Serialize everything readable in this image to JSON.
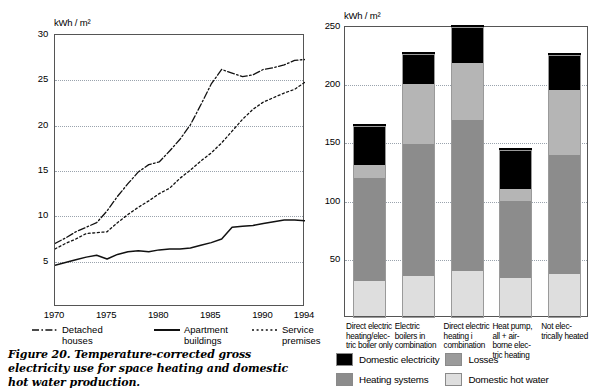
{
  "caption": "Figure 20.  Temperature-corrected gross electricity use for space heating and domestic hot water production.",
  "line_chart": {
    "unit_label": "kWh / m²",
    "y_ticks": [
      "5",
      "10",
      "15",
      "20",
      "25",
      "30"
    ],
    "x_ticks": [
      "1970",
      "1975",
      "1980",
      "1985",
      "1990",
      "1994"
    ],
    "legend": [
      {
        "label_line1": "Detached",
        "label_line2": "houses",
        "style": "dash-dot"
      },
      {
        "label_line1": "Apartment",
        "label_line2": "buildings",
        "style": "solid"
      },
      {
        "label_line1": "Service",
        "label_line2": "premises",
        "style": "dotted"
      }
    ]
  },
  "bar_chart": {
    "unit_label": "kWh / m²",
    "y_ticks": [
      "50",
      "100",
      "150",
      "200",
      "250"
    ],
    "categories": [
      "Direct electric\nheating/elec-\ntric boiler only",
      "Electric\nboilers in\ncombination",
      "Direct electric\nheating i\ncombination",
      "Heat pump,\nall + air-\nborne elec-\ntric heating",
      "Not elec-\ntrically heated"
    ],
    "legend": [
      {
        "label": "Domestic electricity",
        "color": "#000000"
      },
      {
        "label": "Losses",
        "color": "#9b9b9b"
      },
      {
        "label": "Heating systems",
        "color": "#8c8c8c"
      },
      {
        "label": "Domestic hot water",
        "color": "#dedede"
      }
    ]
  },
  "chart_data": [
    {
      "type": "line",
      "title": "Temperature-corrected gross electricity use",
      "xlabel": "",
      "ylabel": "kWh / m²",
      "xlim": [
        1970,
        1994
      ],
      "ylim": [
        0,
        30
      ],
      "grid": true,
      "legend_position": "below",
      "x": [
        1970,
        1971,
        1972,
        1973,
        1974,
        1975,
        1976,
        1977,
        1978,
        1979,
        1980,
        1981,
        1982,
        1983,
        1984,
        1985,
        1986,
        1987,
        1988,
        1989,
        1990,
        1991,
        1992,
        1993,
        1994
      ],
      "series": [
        {
          "name": "Detached houses",
          "style": "dash-dot",
          "values": [
            7.0,
            7.6,
            8.3,
            8.8,
            9.3,
            10.6,
            12.2,
            13.6,
            14.9,
            15.7,
            16.0,
            17.2,
            18.5,
            20.1,
            22.3,
            24.6,
            26.2,
            25.8,
            25.4,
            25.6,
            26.2,
            26.4,
            26.7,
            27.2,
            27.3
          ]
        },
        {
          "name": "Apartment buildings",
          "style": "solid",
          "values": [
            4.6,
            4.9,
            5.2,
            5.5,
            5.7,
            5.3,
            5.8,
            6.1,
            6.2,
            6.1,
            6.3,
            6.4,
            6.4,
            6.5,
            6.8,
            7.1,
            7.5,
            8.8,
            8.9,
            9.0,
            9.2,
            9.4,
            9.6,
            9.6,
            9.5
          ]
        },
        {
          "name": "Service premises",
          "style": "dotted",
          "values": [
            6.4,
            7.0,
            7.5,
            8.1,
            8.2,
            8.3,
            9.3,
            10.2,
            11.0,
            11.7,
            12.5,
            13.1,
            14.2,
            15.1,
            16.1,
            17.0,
            18.1,
            19.4,
            20.7,
            21.8,
            22.6,
            23.1,
            23.6,
            24.0,
            24.8
          ]
        }
      ]
    },
    {
      "type": "bar",
      "subtype": "stacked",
      "title": "Gross electricity use by heating category",
      "xlabel": "",
      "ylabel": "kWh / m²",
      "ylim": [
        0,
        250
      ],
      "grid": true,
      "legend_position": "below",
      "categories": [
        "Direct electric heating/electric boiler only",
        "Electric boilers in combination",
        "Direct electric heating i combination",
        "Heat pump, all + airborne electric heating",
        "Not electrically heated"
      ],
      "series": [
        {
          "name": "Domestic hot water",
          "color": "#dedede",
          "values": [
            30,
            34,
            39,
            33,
            36
          ]
        },
        {
          "name": "Heating systems",
          "color": "#8c8c8c",
          "values": [
            89,
            114,
            129,
            66,
            102
          ]
        },
        {
          "name": "Losses",
          "color": "#b5b5b5",
          "values": [
            11,
            51,
            49,
            10,
            56
          ]
        },
        {
          "name": "Domestic electricity",
          "color": "#000000",
          "values": [
            35,
            28,
            33,
            35,
            32
          ]
        }
      ],
      "totals": [
        165,
        227,
        250,
        144,
        226
      ]
    }
  ]
}
